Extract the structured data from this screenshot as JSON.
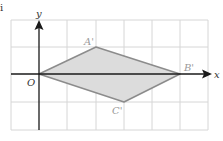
{
  "corner_label": "i",
  "axes": {
    "x_label": "x",
    "y_label": "y",
    "origin_label": "O"
  },
  "grid": {
    "columns": 7,
    "rows": 4,
    "x_range": [
      -1,
      6
    ],
    "y_range": [
      -2,
      2
    ],
    "unit_px": 28
  },
  "shape": {
    "name": "quadrilateral O A' B' C'",
    "vertices": [
      {
        "label": "O",
        "x": 0,
        "y": 0
      },
      {
        "label": "A'",
        "x": 2,
        "y": 1
      },
      {
        "label": "B'",
        "x": 5,
        "y": 0
      },
      {
        "label": "C'",
        "x": 3,
        "y": -1
      }
    ],
    "fill_color": "#dcdcdc",
    "stroke_color": "#8c8c8c"
  },
  "labels": {
    "a_prime": "A'",
    "b_prime": "B'",
    "c_prime": "C'"
  },
  "colors": {
    "grid": "#d6d6d6",
    "axes": "#1a1a1a",
    "vertex_label": "#9a9a9a"
  }
}
